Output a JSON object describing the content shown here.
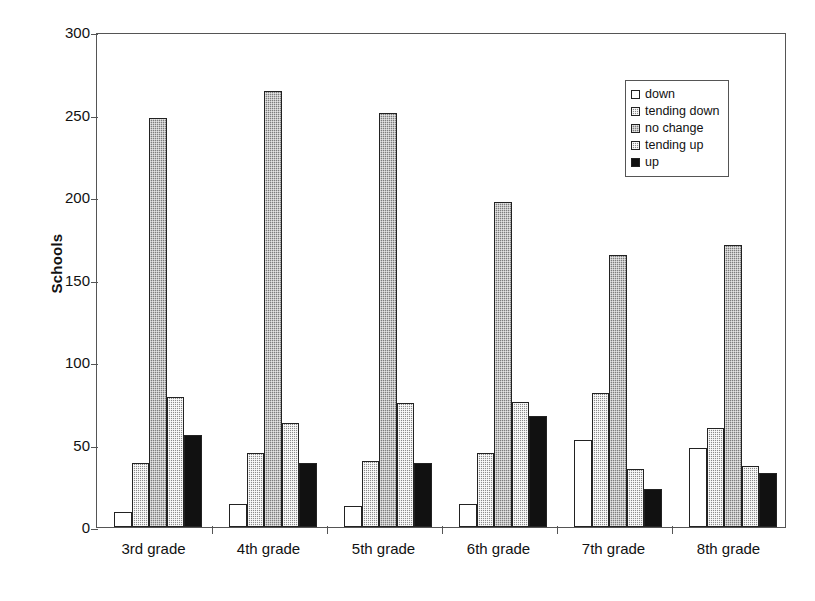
{
  "chart_data": {
    "type": "bar",
    "title": "",
    "subtitle": "",
    "xlabel": "",
    "ylabel": "Schools",
    "ylim": [
      0,
      300
    ],
    "yticks": [
      0,
      50,
      100,
      150,
      200,
      250,
      300
    ],
    "grid": false,
    "legend_position": "top-right",
    "categories": [
      "3rd grade",
      "4th grade",
      "5th grade",
      "6th grade",
      "7th grade",
      "8th grade"
    ],
    "series": [
      {
        "name": "down",
        "values": [
          9,
          14,
          13,
          14,
          53,
          48
        ],
        "fill": "white",
        "color": "#ffffff"
      },
      {
        "name": "tending down",
        "values": [
          39,
          45,
          40,
          45,
          81,
          60
        ],
        "fill": "hatch-light",
        "color": "#8c8c8c"
      },
      {
        "name": "no change",
        "values": [
          248,
          264,
          251,
          197,
          165,
          171
        ],
        "fill": "hatch-gray",
        "color": "#7d7d7d"
      },
      {
        "name": "tending up",
        "values": [
          79,
          63,
          75,
          76,
          35,
          37
        ],
        "fill": "hatch-light",
        "color": "#8c8c8c"
      },
      {
        "name": "up",
        "values": [
          56,
          39,
          39,
          67,
          23,
          33
        ],
        "fill": "solid-black",
        "color": "#111111"
      }
    ]
  },
  "axis": {
    "y_title": "Schools",
    "y_tick_labels": [
      "300",
      "250",
      "200",
      "150",
      "100",
      "50",
      "0"
    ],
    "x_tick_labels": [
      "3rd grade",
      "4th grade",
      "5th grade",
      "6th grade",
      "7th grade",
      "8th grade"
    ]
  },
  "legend": {
    "items": [
      {
        "label": "down"
      },
      {
        "label": "tending down"
      },
      {
        "label": "no change"
      },
      {
        "label": "tending up"
      },
      {
        "label": "up"
      }
    ]
  }
}
